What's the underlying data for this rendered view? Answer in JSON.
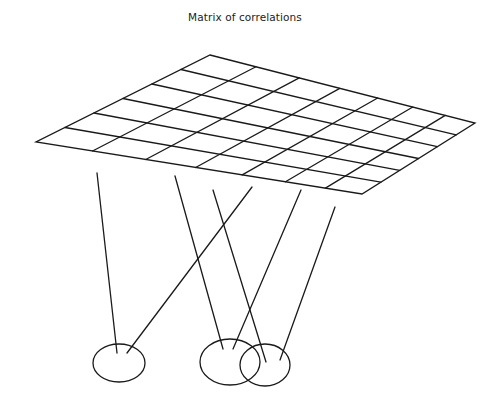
{
  "title": "Matrix of correlations",
  "style": {
    "stroke_color": "#1a1a1a",
    "background": "#ffffff"
  },
  "grid": {
    "rows": 6,
    "cols": 7,
    "corners": {
      "top": [
        210,
        55
      ],
      "right": [
        475,
        123
      ],
      "bottom": [
        362,
        194
      ],
      "left": [
        36,
        142
      ]
    }
  },
  "connectors": [
    {
      "from": [
        97,
        173
      ],
      "to": [
        117,
        353
      ]
    },
    {
      "from": [
        252,
        187
      ],
      "to": [
        127,
        353
      ]
    },
    {
      "from": [
        175,
        176
      ],
      "to": [
        223,
        349
      ]
    },
    {
      "from": [
        213,
        190
      ],
      "to": [
        266,
        362
      ]
    },
    {
      "from": [
        301,
        190
      ],
      "to": [
        233,
        349
      ]
    },
    {
      "from": [
        335,
        207
      ],
      "to": [
        280,
        360
      ]
    }
  ],
  "ellipses": [
    {
      "cx": 119,
      "cy": 363,
      "rx": 26,
      "ry": 19
    },
    {
      "cx": 230,
      "cy": 362,
      "rx": 30,
      "ry": 23
    },
    {
      "cx": 265,
      "cy": 365,
      "rx": 25,
      "ry": 21
    }
  ]
}
